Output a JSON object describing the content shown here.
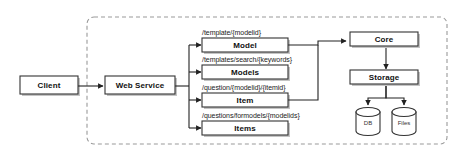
{
  "diagram": {
    "boundary": {
      "name": "system-boundary",
      "style": "dashed-rounded-rectangle"
    },
    "colors": {
      "stroke": "#333333",
      "fill": "#ffffff",
      "shadow": "#bdbdbd",
      "text": "#111111",
      "dashed_border": "#999999"
    },
    "nodes": {
      "client": "Client",
      "web_service": "Web Service",
      "model": "Model",
      "models": "Models",
      "item": "Item",
      "items": "Items",
      "core": "Core",
      "storage": "Storage",
      "db": "DB",
      "files": "Files"
    },
    "endpoints": [
      "/template/{modelid}",
      "/templates/search/{keywords}",
      "/question/{modelid}/{itemid}",
      "/questions/formodels/{modelids}"
    ]
  }
}
